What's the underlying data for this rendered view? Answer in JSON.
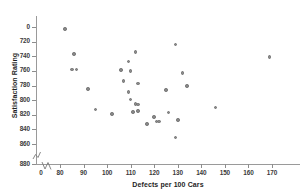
{
  "chart_data": {
    "type": "scatter",
    "title": "",
    "xlabel": "Defects per 100 Cars",
    "ylabel": "Satisfaction Rating",
    "xlim": [
      75,
      175
    ],
    "ylim": [
      715,
      890
    ],
    "xticks": [
      0,
      80,
      90,
      100,
      110,
      120,
      130,
      140,
      150,
      160,
      170
    ],
    "yticks": [
      0,
      720,
      740,
      760,
      780,
      800,
      820,
      840,
      860,
      880
    ],
    "grid": false,
    "legend": null,
    "axis_break_x": true,
    "axis_break_y": true,
    "marker_color": "#8b8b8b",
    "points": [
      {
        "x": 82,
        "y": 877
      },
      {
        "x": 86,
        "y": 843
      },
      {
        "x": 85,
        "y": 822
      },
      {
        "x": 87,
        "y": 822
      },
      {
        "x": 92,
        "y": 795
      },
      {
        "x": 95,
        "y": 767
      },
      {
        "x": 102,
        "y": 761
      },
      {
        "x": 106,
        "y": 821
      },
      {
        "x": 107,
        "y": 806
      },
      {
        "x": 109,
        "y": 833
      },
      {
        "x": 109,
        "y": 791
      },
      {
        "x": 110,
        "y": 820
      },
      {
        "x": 110,
        "y": 781
      },
      {
        "x": 111,
        "y": 764
      },
      {
        "x": 112,
        "y": 846
      },
      {
        "x": 112,
        "y": 775
      },
      {
        "x": 113,
        "y": 774
      },
      {
        "x": 113,
        "y": 803
      },
      {
        "x": 113,
        "y": 765
      },
      {
        "x": 117,
        "y": 747
      },
      {
        "x": 120,
        "y": 757
      },
      {
        "x": 121,
        "y": 751
      },
      {
        "x": 122,
        "y": 751
      },
      {
        "x": 125,
        "y": 794
      },
      {
        "x": 126,
        "y": 763
      },
      {
        "x": 129,
        "y": 856
      },
      {
        "x": 129,
        "y": 729
      },
      {
        "x": 130,
        "y": 753
      },
      {
        "x": 132,
        "y": 817
      },
      {
        "x": 134,
        "y": 799
      },
      {
        "x": 146,
        "y": 770
      },
      {
        "x": 169,
        "y": 839
      }
    ]
  },
  "axis": {
    "x_tick_labels": [
      "0",
      "80",
      "90",
      "100",
      "110",
      "120",
      "130",
      "140",
      "150",
      "160",
      "170"
    ],
    "y_tick_labels": [
      "880",
      "860",
      "840",
      "820",
      "800",
      "780",
      "760",
      "740",
      "720",
      "0"
    ],
    "x_title": "Defects per 100 Cars",
    "y_title": "Satisfaction Rating"
  }
}
